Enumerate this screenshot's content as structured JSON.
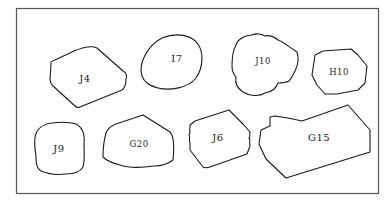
{
  "diagram": {
    "colors": {
      "frame": "#555555",
      "outline": "#1a1a1a",
      "text": "#222222",
      "background": "#ffffff"
    },
    "shapes": [
      {
        "id": "J4",
        "label": "J4"
      },
      {
        "id": "I7",
        "label": "I7"
      },
      {
        "id": "J10",
        "label": "J10"
      },
      {
        "id": "H10",
        "label": "H10"
      },
      {
        "id": "J9",
        "label": "J9"
      },
      {
        "id": "G20",
        "label": "G20"
      },
      {
        "id": "J6",
        "label": "J6"
      },
      {
        "id": "G15",
        "label": "G15"
      }
    ]
  }
}
